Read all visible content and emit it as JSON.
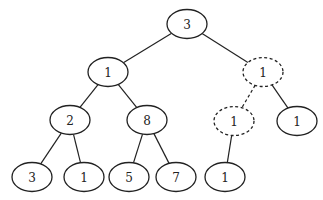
{
  "diagram": {
    "type": "binary-tree",
    "nodes": [
      {
        "id": "n0",
        "label": "3",
        "style": "solid"
      },
      {
        "id": "n1",
        "label": "1",
        "style": "solid"
      },
      {
        "id": "n2",
        "label": "1",
        "style": "dashed"
      },
      {
        "id": "n3",
        "label": "2",
        "style": "solid"
      },
      {
        "id": "n4",
        "label": "8",
        "style": "solid"
      },
      {
        "id": "n5",
        "label": "1",
        "style": "dashed"
      },
      {
        "id": "n6",
        "label": "1",
        "style": "solid"
      },
      {
        "id": "n7",
        "label": "3",
        "style": "solid"
      },
      {
        "id": "n8",
        "label": "1",
        "style": "solid"
      },
      {
        "id": "n9",
        "label": "5",
        "style": "solid"
      },
      {
        "id": "n10",
        "label": "7",
        "style": "solid"
      },
      {
        "id": "n11",
        "label": "1",
        "style": "solid"
      }
    ],
    "edges": [
      {
        "from": "n0",
        "to": "n1",
        "style": "solid"
      },
      {
        "from": "n0",
        "to": "n2",
        "style": "solid"
      },
      {
        "from": "n1",
        "to": "n3",
        "style": "solid"
      },
      {
        "from": "n1",
        "to": "n4",
        "style": "solid"
      },
      {
        "from": "n2",
        "to": "n5",
        "style": "dashed"
      },
      {
        "from": "n2",
        "to": "n6",
        "style": "solid"
      },
      {
        "from": "n3",
        "to": "n7",
        "style": "solid"
      },
      {
        "from": "n3",
        "to": "n8",
        "style": "solid"
      },
      {
        "from": "n4",
        "to": "n9",
        "style": "solid"
      },
      {
        "from": "n4",
        "to": "n10",
        "style": "solid"
      },
      {
        "from": "n5",
        "to": "n11",
        "style": "solid"
      }
    ]
  }
}
